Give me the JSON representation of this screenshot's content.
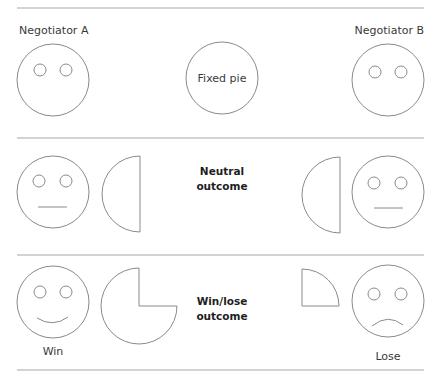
{
  "diagram": {
    "type": "negotiation-outcomes",
    "rows": [
      {
        "id": "setup",
        "left_label": "Negotiator A",
        "center_label": "Fixed pie",
        "right_label": "Negotiator B",
        "left_face": "neutral-no-mouth",
        "right_face": "neutral-no-mouth",
        "pie_share": 1.0
      },
      {
        "id": "neutral",
        "title_line1": "Neutral",
        "title_line2": "outcome",
        "left_face": "neutral",
        "right_face": "neutral",
        "left_pie_share": 0.5,
        "right_pie_share": 0.5
      },
      {
        "id": "winlose",
        "title_line1": "Win/lose",
        "title_line2": "outcome",
        "left_face": "smile",
        "right_face": "frown",
        "left_pie_share": 0.75,
        "right_pie_share": 0.25,
        "left_caption": "Win",
        "right_caption": "Lose"
      }
    ]
  }
}
